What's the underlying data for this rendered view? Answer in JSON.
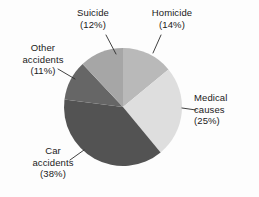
{
  "chart_data": {
    "type": "pie",
    "title": "",
    "subtitle": "",
    "xlabel": "",
    "ylabel": "",
    "legend_position": "none",
    "grid": false,
    "start_angle_deg": 0,
    "direction": "clockwise",
    "categories": [
      "Homicide",
      "Medical causes",
      "Car accidents",
      "Other accidents",
      "Suicide"
    ],
    "values": [
      14,
      25,
      38,
      11,
      12
    ],
    "unit": "%",
    "slices": [
      {
        "name": "Homicide",
        "label": "Homicide",
        "value": 14,
        "percent_text": "(14%)",
        "color": "#b9b9b9"
      },
      {
        "name": "Medical causes",
        "label_line1": "Medical",
        "label_line2": "causes",
        "value": 25,
        "percent_text": "(25%)",
        "color": "#dedede"
      },
      {
        "name": "Car accidents",
        "label_line1": "Car",
        "label_line2": "accidents",
        "value": 38,
        "percent_text": "(38%)",
        "color": "#535353"
      },
      {
        "name": "Other accidents",
        "label_line1": "Other",
        "label_line2": "accidents",
        "value": 11,
        "percent_text": "(11%)",
        "color": "#666666"
      },
      {
        "name": "Suicide",
        "label": "Suicide",
        "value": 12,
        "percent_text": "(12%)",
        "color": "#a6a6a6"
      }
    ]
  },
  "labels": {
    "suicide": {
      "name": "Suicide",
      "percent": "(12%)"
    },
    "homicide": {
      "name": "Homicide",
      "percent": "(14%)"
    },
    "other_accidents": {
      "line1": "Other",
      "line2": "accidents",
      "percent": "(11%)"
    },
    "medical_causes": {
      "line1": "Medical",
      "line2": "causes",
      "percent": "(25%)"
    },
    "car_accidents": {
      "line1": "Car",
      "line2": "accidents",
      "percent": "(38%)"
    }
  },
  "colors": {
    "background": "#fdfdfd",
    "text": "#1a1a1a",
    "leader_line": "#2b2b2b",
    "homicide": "#b9b9b9",
    "medical_causes": "#dedede",
    "car_accidents": "#535353",
    "other_accidents": "#666666",
    "suicide": "#a6a6a6"
  }
}
